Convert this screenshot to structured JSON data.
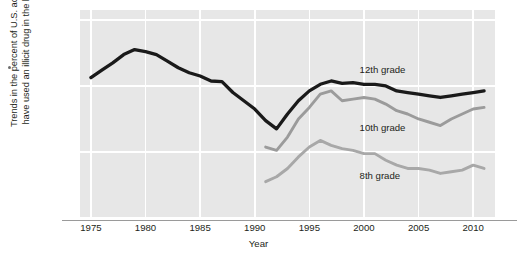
{
  "chart_data": {
    "type": "line",
    "title": "",
    "xlabel": "Year",
    "ylabel": "Trends in the percent of U.S. adolescents who have used an illicit drug in the last 12 months",
    "ylabel_line1": "Trends in the percent of U.S. adolescents who",
    "ylabel_line2": "have used an illicit drug in the last 12 months",
    "xlim": [
      1974,
      2012
    ],
    "ylim": [
      0,
      63
    ],
    "xticks": [
      1975,
      1980,
      1985,
      1990,
      1995,
      2000,
      2005,
      2010
    ],
    "yticks": [
      0,
      20,
      40,
      60
    ],
    "grid": "white gridlines on light gray panel, vertical at each x tick, horizontal at each y tick",
    "legend_position": "inline labels on plot",
    "series": [
      {
        "name": "12th grade",
        "color": "#1a1a1a",
        "label_x": 1999.6,
        "label_y": 44.5,
        "x": [
          1975,
          1976,
          1977,
          1978,
          1979,
          1980,
          1981,
          1982,
          1983,
          1984,
          1985,
          1986,
          1987,
          1988,
          1989,
          1990,
          1991,
          1992,
          1993,
          1994,
          1995,
          1996,
          1997,
          1998,
          1999,
          2000,
          2001,
          2002,
          2003,
          2004,
          2005,
          2006,
          2007,
          2008,
          2009,
          2010,
          2011
        ],
        "values": [
          42.5,
          44.8,
          47.0,
          49.5,
          51.0,
          50.4,
          49.5,
          47.5,
          45.5,
          44.0,
          43.0,
          41.5,
          41.3,
          38.0,
          35.5,
          33.0,
          29.5,
          27.0,
          31.5,
          35.5,
          38.5,
          40.5,
          41.5,
          40.8,
          41.0,
          40.5,
          40.5,
          40.0,
          38.5,
          38.0,
          37.5,
          37.0,
          36.5,
          37.0,
          37.5,
          38.0,
          38.5
        ],
        "notes": "peak ~51 in 1979, minimum ~27 in 1992, second peak ~41.5 in 1997, rises again to ~38.5 by 2011"
      },
      {
        "name": "10th grade",
        "color": "#9b9b9b",
        "label_x": 1999.6,
        "label_y": 27.0,
        "x": [
          1991,
          1992,
          1993,
          1994,
          1995,
          1996,
          1997,
          1998,
          1999,
          2000,
          2001,
          2002,
          2003,
          2004,
          2005,
          2006,
          2007,
          2008,
          2009,
          2010,
          2011
        ],
        "values": [
          21.5,
          20.5,
          24.5,
          30.0,
          33.5,
          37.5,
          38.5,
          35.5,
          36.0,
          36.5,
          36.0,
          34.5,
          32.5,
          31.5,
          30.0,
          29.0,
          28.0,
          30.0,
          31.5,
          33.0,
          33.5
        ],
        "notes": "starts ~21.5 in 1991, peaks ~38.5 in 1997, declines to ~28 by 2007, rises to ~33.5 by 2011"
      },
      {
        "name": "8th grade",
        "color": "#a8a8a8",
        "label_x": 1999.6,
        "label_y": 12.5,
        "x": [
          1991,
          1992,
          1993,
          1994,
          1995,
          1996,
          1997,
          1998,
          1999,
          2000,
          2001,
          2002,
          2003,
          2004,
          2005,
          2006,
          2007,
          2008,
          2009,
          2010,
          2011
        ],
        "values": [
          11.0,
          12.5,
          15.0,
          18.5,
          21.5,
          23.5,
          22.0,
          21.0,
          20.5,
          19.5,
          19.5,
          17.5,
          16.0,
          15.0,
          15.0,
          14.5,
          13.5,
          14.0,
          14.5,
          16.0,
          15.0
        ],
        "notes": "starts ~11 in 1991, peaks ~23.5 in 1996, declines to ~13.5 by 2007, small rise to ~16 in 2010"
      }
    ]
  },
  "panel": {
    "background_color": "#e7e7e7",
    "gridline_color": "#ffffff",
    "axis_color": "#9a9a9a"
  }
}
